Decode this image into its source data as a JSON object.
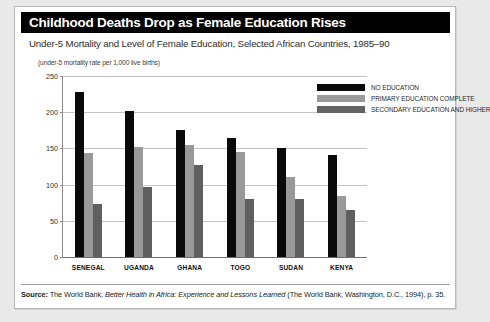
{
  "card": {
    "title": "Childhood Deaths Drop as Female Education Rises",
    "subtitle": "Under-5 Mortality and Level of Female Education, Selected African Countries, 1985–90",
    "axis_note": "(under-5 mortality rate per 1,000 live births)"
  },
  "source": {
    "label": "Source:",
    "text_before_italic": " The World Bank, ",
    "italic_title": "Better Health in Africa: Experience and Lessons Learned",
    "text_after_italic": " (The World Bank, Washington, D.C., 1994), p. 35."
  },
  "legend": {
    "items": [
      {
        "label": "NO EDUCATION",
        "color": "#0a0a0a"
      },
      {
        "label": "PRIMARY EDUCATION COMPLETE",
        "color": "#9a9a9a"
      },
      {
        "label": "SECONDARY EDUCATION AND HIGHER",
        "color": "#636363"
      }
    ]
  },
  "chart_data": {
    "type": "bar",
    "title": "Childhood Deaths Drop as Female Education Rises",
    "subtitle": "Under-5 Mortality and Level of Female Education, Selected African Countries, 1985–90",
    "xlabel": "",
    "ylabel": "(under-5 mortality rate per 1,000 live births)",
    "ylim": [
      0,
      250
    ],
    "yticks": [
      0,
      50,
      100,
      150,
      200,
      250
    ],
    "grid": true,
    "legend_position": "top-right",
    "categories": [
      "SENEGAL",
      "UGANDA",
      "GHANA",
      "TOGO",
      "SUDAN",
      "KENYA"
    ],
    "series": [
      {
        "name": "NO EDUCATION",
        "color": "#0a0a0a",
        "values": [
          228,
          201,
          175,
          165,
          150,
          141
        ]
      },
      {
        "name": "PRIMARY EDUCATION COMPLETE",
        "color": "#999999",
        "values": [
          143,
          152,
          155,
          145,
          110,
          84
        ]
      },
      {
        "name": "SECONDARY EDUCATION AND HIGHER",
        "color": "#5f5f5f",
        "values": [
          73,
          97,
          127,
          80,
          80,
          65
        ]
      }
    ]
  }
}
